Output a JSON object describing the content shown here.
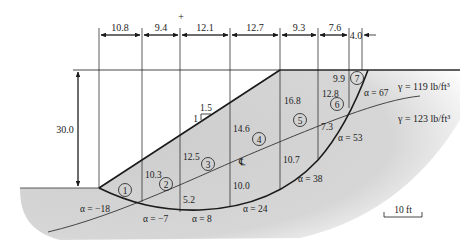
{
  "diagram": {
    "type": "slope-stability-method-of-slices",
    "widths": [
      "10.8",
      "9.4",
      "12.1",
      "12.7",
      "9.3",
      "7.6",
      "4.0"
    ],
    "height_label": "30.0",
    "slope_ratio": {
      "rise": "1",
      "run": "1.5"
    },
    "slices": [
      {
        "id": "1",
        "top_height": ""
      },
      {
        "id": "2",
        "top_height": "10.3"
      },
      {
        "id": "3",
        "top_height": "12.5"
      },
      {
        "id": "4",
        "top_height": "14.6"
      },
      {
        "id": "5",
        "top_height": "16.8"
      },
      {
        "id": "6",
        "top_height": "12.8"
      },
      {
        "id": "7",
        "top_height": "9.9"
      }
    ],
    "lower_heights": [
      "5.2",
      "10.0",
      "10.7",
      "7.3"
    ],
    "alphas": [
      "α = −18",
      "α = −7",
      "α = 8",
      "α = 24",
      "α = 38",
      "α = 53",
      "α = 67"
    ],
    "soil_layers": [
      {
        "label": "γ = 119 lb/ft³"
      },
      {
        "label": "γ = 123 lb/ft³"
      }
    ],
    "scale_bar": "10 ft",
    "center_mark": "+",
    "centerline_symbol": "℄"
  },
  "colors": {
    "soil_fill": "#cfcfcf",
    "ground_fill": "#d8d8d8",
    "line": "#1a1a1a",
    "background": "#ffffff"
  }
}
